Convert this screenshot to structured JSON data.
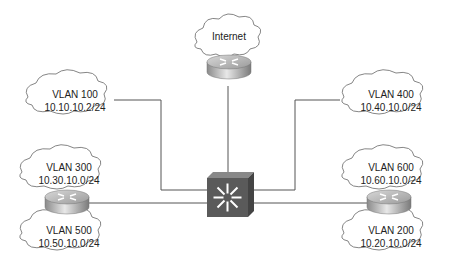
{
  "diagram": {
    "internet": {
      "label": "Internet"
    },
    "clouds": [
      {
        "id": "vlan100",
        "name": "VLAN 100",
        "subnet": "10.10.10.2/24"
      },
      {
        "id": "vlan400",
        "name": "VLAN 400",
        "subnet": "10.40.10.0/24"
      },
      {
        "id": "vlan300",
        "name": "VLAN 300",
        "subnet": "10.30.10.0/24"
      },
      {
        "id": "vlan500",
        "name": "VLAN 500",
        "subnet": "10.50.10.0/24"
      },
      {
        "id": "vlan600",
        "name": "VLAN 600",
        "subnet": "10.60.10.0/24"
      },
      {
        "id": "vlan200",
        "name": "VLAN 200",
        "subnet": "10.20.10.0/24"
      }
    ],
    "devices": [
      {
        "id": "internet-router",
        "type": "router"
      },
      {
        "id": "left-router",
        "type": "router"
      },
      {
        "id": "right-router",
        "type": "router"
      },
      {
        "id": "core-switch",
        "type": "multilayer-switch"
      }
    ],
    "colors": {
      "line": "#555555",
      "cloud_stroke": "#666666",
      "switch": "#5a5a5a",
      "router": "#b8b8b8"
    }
  }
}
